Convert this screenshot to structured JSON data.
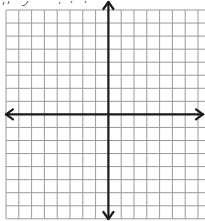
{
  "diagram": {
    "type": "coordinate-plane",
    "cut_off_header_text": "",
    "grid": {
      "columns": 16,
      "rows": 16,
      "origin_x": 6,
      "origin_y": 10,
      "cell_w": 12.8,
      "cell_h": 13.05,
      "line_color": "#9a9a9a",
      "line_width": 1
    },
    "axes": {
      "color": "#1a1a1a",
      "width": 2.2,
      "x_axis_row": 8,
      "y_axis_col": 8,
      "arrows": [
        "up",
        "down",
        "left",
        "right"
      ]
    }
  }
}
